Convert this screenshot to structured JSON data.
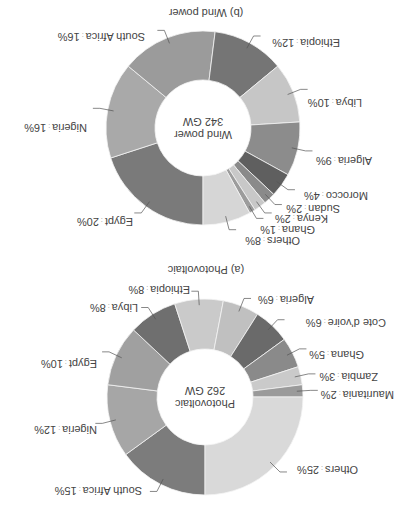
{
  "chart_data": [
    {
      "type": "pie",
      "variant": "donut",
      "title": "(a) Photovoltaic",
      "center_label": [
        "Photovoltaic",
        "262 GW"
      ],
      "total": "262 GW",
      "categories": [
        "South Africa",
        "Nigeria",
        "Egypt",
        "Libya",
        "Ethiopia",
        "Algeria",
        "Cote d'voire",
        "Ghana",
        "Zambia",
        "Mauritania",
        "Others"
      ],
      "values": [
        15,
        12,
        10,
        8,
        8,
        6,
        6,
        5,
        3,
        2,
        25
      ],
      "unit": "%",
      "start_angle": "12 o'clock",
      "direction": "clockwise",
      "colors": [
        "#7c7c7c",
        "#a6a6a6",
        "#a0a0a0",
        "#6f6f6f",
        "#cacaca",
        "#c0c0c0",
        "#6a6a6a",
        "#8a8a8a",
        "#cacaca",
        "#9a9a9a",
        "#d9d9d9"
      ]
    },
    {
      "type": "pie",
      "variant": "donut",
      "title": "(b) Wind power",
      "center_label": [
        "Wind power",
        "342 GW"
      ],
      "total": "342 GW",
      "categories": [
        "Egypt",
        "Nigeria",
        "South Africa",
        "Ethiopia",
        "Libya",
        "Algeria",
        "Morocco",
        "Sudan",
        "Kenya",
        "Ghana",
        "Others"
      ],
      "values": [
        20,
        16,
        16,
        12,
        10,
        9,
        4,
        2,
        2,
        1,
        8
      ],
      "unit": "%",
      "start_angle": "12 o'clock",
      "direction": "clockwise",
      "colors": [
        "#7a7a7a",
        "#a9a9a9",
        "#9b9b9b",
        "#757575",
        "#c6c6c6",
        "#8c8c8c",
        "#5f5f5f",
        "#8a8a8a",
        "#c8c8c8",
        "#9c9c9c",
        "#d6d6d6"
      ]
    }
  ],
  "display": {
    "orientation": "rotated 180 degrees",
    "pv": {
      "title": "(a) Photovoltaic",
      "center_line1": "Photovoltaic",
      "center_line2": "262 GW",
      "labels": [
        {
          "name": "South Africa",
          "pct": "15%",
          "x": 270,
          "y": 21
        },
        {
          "name": "Nigeria",
          "pct": "12%",
          "x": 315,
          "y": 82
        },
        {
          "name": "Egypt",
          "pct": "10%",
          "x": 315,
          "y": 148
        },
        {
          "name": "Libya",
          "pct": "8%",
          "x": 274,
          "y": 204
        },
        {
          "name": "Ethiopia",
          "pct": "8%",
          "x": 222,
          "y": 222
        },
        {
          "name": "Algeria",
          "pct": "6%",
          "x": 98,
          "y": 212
        },
        {
          "name": "Cote d'voire",
          "pct": "6%",
          "x": 26,
          "y": 189
        },
        {
          "name": "Ghana",
          "pct": "5%",
          "x": 48,
          "y": 157
        },
        {
          "name": "Zambia",
          "pct": "3%",
          "x": 34,
          "y": 135
        },
        {
          "name": "Mauritania",
          "pct": "2%",
          "x": 18,
          "y": 117
        },
        {
          "name": "Others",
          "pct": "25%",
          "x": 54,
          "y": 42
        }
      ]
    },
    "wind": {
      "title": "(b) Wind power",
      "center_line1": "Wind power",
      "center_line2": "342 GW",
      "labels": [
        {
          "name": "Egypt",
          "pct": "20%",
          "x": 279,
          "y": 290
        },
        {
          "name": "Nigeria",
          "pct": "16%",
          "x": 325,
          "y": 384
        },
        {
          "name": "South Africa",
          "pct": "16%",
          "x": 267,
          "y": 475
        },
        {
          "name": "Ethiopia",
          "pct": "12%",
          "x": 72,
          "y": 469
        },
        {
          "name": "Libya",
          "pct": "10%",
          "x": 50,
          "y": 409
        },
        {
          "name": "Algeria",
          "pct": "9%",
          "x": 40,
          "y": 351
        },
        {
          "name": "Morocco",
          "pct": "4%",
          "x": 44,
          "y": 316
        },
        {
          "name": "Sudan",
          "pct": "2%",
          "x": 72,
          "y": 303
        },
        {
          "name": "Kenya",
          "pct": "2%",
          "x": 84,
          "y": 293
        },
        {
          "name": "Ghana",
          "pct": "1%",
          "x": 97,
          "y": 282
        },
        {
          "name": "Others",
          "pct": "8%",
          "x": 112,
          "y": 271
        }
      ]
    }
  }
}
